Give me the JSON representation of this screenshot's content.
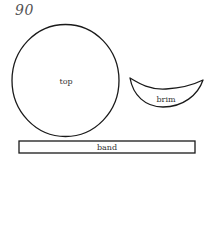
{
  "page_number": "90",
  "pieces": {
    "top": {
      "label": "top"
    },
    "brim": {
      "label": "brim"
    },
    "band": {
      "label": "band"
    }
  },
  "colors": {
    "stroke": "#1a1a1a",
    "text": "#333333",
    "page_number": "#555555",
    "background": "#ffffff"
  }
}
